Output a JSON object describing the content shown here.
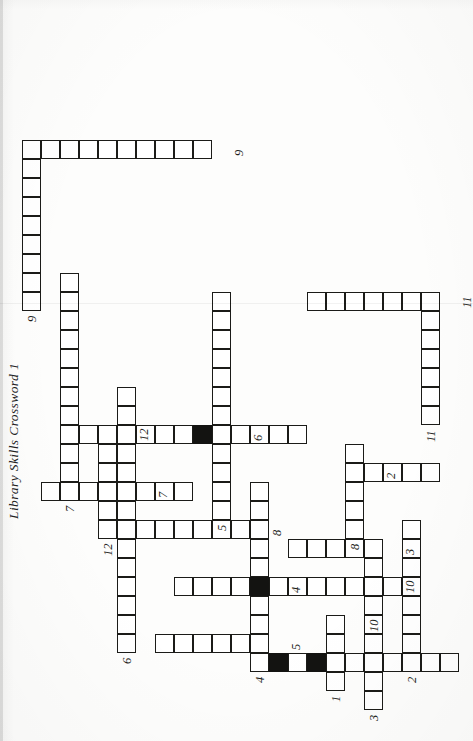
{
  "document": {
    "title": "Library Skills Crossword 1",
    "type": "crossword-worksheet",
    "orientation": "rotated-90-ccw",
    "paper_color": "#fdfdfc",
    "ink_color": "#1b1b18",
    "block_color": "#131311"
  },
  "grid": {
    "cell_size": 19,
    "origin_x": 12,
    "origin_y": 22,
    "columns": 38,
    "rows": 24,
    "entries": [
      {
        "number": "1",
        "direction": "across",
        "row": 17,
        "col": 3,
        "length": 4
      },
      {
        "number": "1",
        "direction": "down",
        "row": 14,
        "col": 4,
        "length": 10
      },
      {
        "number": "2",
        "direction": "across",
        "row": 21,
        "col": 4,
        "length": 8
      },
      {
        "number": "2",
        "direction": "down",
        "row": 18,
        "col": 14,
        "length": 5
      },
      {
        "number": "3",
        "direction": "across",
        "row": 19,
        "col": 2,
        "length": 9
      },
      {
        "number": "3",
        "direction": "down",
        "row": 15,
        "col": 10,
        "length": 5
      },
      {
        "number": "4",
        "direction": "across",
        "row": 13,
        "col": 4,
        "length": 10
      },
      {
        "number": "4",
        "direction": "down",
        "row": 9,
        "col": 8,
        "length": 7
      },
      {
        "number": "5",
        "direction": "across",
        "row": 11,
        "col": 12,
        "length": 12
      },
      {
        "number": "5",
        "direction": "down",
        "row": 8,
        "col": 5,
        "length": 6
      },
      {
        "number": "6",
        "direction": "across",
        "row": 6,
        "col": 5,
        "length": 14
      },
      {
        "number": "6",
        "direction": "down",
        "row": 7,
        "col": 16,
        "length": 9
      },
      {
        "number": "7",
        "direction": "across",
        "row": 3,
        "col": 13,
        "length": 12
      },
      {
        "number": "7",
        "direction": "down",
        "row": 2,
        "col": 13,
        "length": 8
      },
      {
        "number": "8",
        "direction": "across",
        "row": 18,
        "col": 11,
        "length": 5
      },
      {
        "number": "8",
        "direction": "down",
        "row": 7,
        "col": 11,
        "length": 6
      },
      {
        "number": "9",
        "direction": "across",
        "row": 1,
        "col": 23,
        "length": 9
      },
      {
        "number": "9",
        "direction": "down",
        "row": 1,
        "col": 31,
        "length": 10
      },
      {
        "number": "10",
        "direction": "across",
        "row": 19,
        "col": 7,
        "length": 4
      },
      {
        "number": "10",
        "direction": "down",
        "row": 12,
        "col": 8,
        "length": 9
      },
      {
        "number": "11",
        "direction": "across",
        "row": 22,
        "col": 17,
        "length": 7
      },
      {
        "number": "11",
        "direction": "down",
        "row": 16,
        "col": 23,
        "length": 7
      },
      {
        "number": "12",
        "direction": "across",
        "row": 5,
        "col": 11,
        "length": 6
      },
      {
        "number": "12",
        "direction": "down",
        "row": 3,
        "col": 16,
        "length": 4
      }
    ],
    "blocked_cells": [
      {
        "row": 14,
        "col": 4
      },
      {
        "row": 16,
        "col": 4
      },
      {
        "row": 13,
        "col": 8
      },
      {
        "row": 10,
        "col": 16
      }
    ]
  },
  "clue_numbers": [
    {
      "label": "9",
      "row": 1,
      "col": 23,
      "anchor": "left"
    },
    {
      "label": "9",
      "row": 11,
      "col": 31,
      "anchor": "below"
    },
    {
      "label": "7",
      "row": 3,
      "col": 13,
      "anchor": "left"
    },
    {
      "label": "12",
      "row": 5,
      "col": 11,
      "anchor": "left"
    },
    {
      "label": "12",
      "row": 6,
      "col": 16,
      "anchor": "below"
    },
    {
      "label": "6",
      "row": 6,
      "col": 5,
      "anchor": "left"
    },
    {
      "label": "7",
      "row": 7,
      "col": 13,
      "anchor": "below"
    },
    {
      "label": "8",
      "row": 13,
      "col": 11,
      "anchor": "below"
    },
    {
      "label": "1",
      "row": 17,
      "col": 3,
      "anchor": "left"
    },
    {
      "label": "5",
      "row": 14,
      "col": 5,
      "anchor": "below"
    },
    {
      "label": "10",
      "row": 19,
      "col": 7,
      "anchor": "left"
    },
    {
      "label": "5",
      "row": 11,
      "col": 12,
      "anchor": "left"
    },
    {
      "label": "6",
      "row": 12,
      "col": 16,
      "anchor": "below"
    },
    {
      "label": "4",
      "row": 13,
      "col": 4,
      "anchor": "left"
    },
    {
      "label": "4",
      "row": 14,
      "col": 8,
      "anchor": "below"
    },
    {
      "label": "3",
      "row": 20,
      "col": 10,
      "anchor": "below"
    },
    {
      "label": "8",
      "row": 18,
      "col": 11,
      "anchor": "left"
    },
    {
      "label": "2",
      "row": 19,
      "col": 14,
      "anchor": "below"
    },
    {
      "label": "3",
      "row": 19,
      "col": 2,
      "anchor": "left"
    },
    {
      "label": "10",
      "row": 20,
      "col": 8,
      "anchor": "below"
    },
    {
      "label": "2",
      "row": 21,
      "col": 4,
      "anchor": "left"
    },
    {
      "label": "11",
      "row": 22,
      "col": 17,
      "anchor": "left"
    },
    {
      "label": "11",
      "row": 23,
      "col": 23,
      "anchor": "below"
    }
  ]
}
